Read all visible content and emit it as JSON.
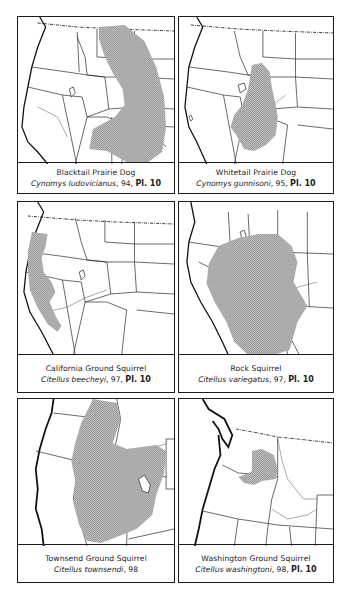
{
  "page": {
    "range_shading_color": "#b3b3b3",
    "line_color": "#1c1c1c"
  },
  "maps": [
    {
      "common_name": "Blacktail Prairie Dog",
      "scientific_name": "Cynomys ludovicianus",
      "page_ref": ", 94, ",
      "plate": "Pl. 10"
    },
    {
      "common_name": "Whitetail Prairie Dog",
      "scientific_name": "Cynomys gunnisoni",
      "page_ref": ", 95, ",
      "plate": "Pl. 10"
    },
    {
      "common_name": "California Ground Squirrel",
      "scientific_name": "Citellus beecheyi",
      "page_ref": ", 97, ",
      "plate": "Pl. 10"
    },
    {
      "common_name": "Rock Squirrel",
      "scientific_name": "Citellus variegatus",
      "page_ref": ", 97, ",
      "plate": "Pl. 10"
    },
    {
      "common_name": "Townsend Ground Squirrel",
      "scientific_name": "Citellus townsendi",
      "page_ref": ", 98",
      "plate": ""
    },
    {
      "common_name": "Washington Ground Squirrel",
      "scientific_name": "Citellus washingtoni",
      "page_ref": ", 98, ",
      "plate": "Pl. 10"
    }
  ]
}
